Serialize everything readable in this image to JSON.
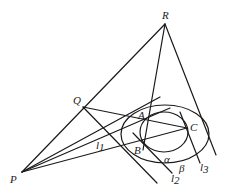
{
  "diagram": {
    "type": "geometry",
    "points": {
      "R": {
        "label": "R",
        "x": 165,
        "y": 24
      },
      "Q": {
        "label": "Q",
        "x": 83,
        "y": 107
      },
      "P": {
        "label": "P",
        "x": 22,
        "y": 172
      },
      "A": {
        "label": "A",
        "x": 146,
        "y": 121
      },
      "B": {
        "label": "B",
        "x": 142,
        "y": 140
      },
      "C": {
        "label": "C",
        "x": 187,
        "y": 128
      }
    },
    "planes": {
      "alpha": {
        "label": "α"
      },
      "beta": {
        "label": "β"
      }
    },
    "lines": {
      "l1": {
        "label": "l",
        "sub": "1"
      },
      "l2": {
        "label": "l",
        "sub": "2"
      },
      "l3": {
        "label": "l",
        "sub": "3"
      }
    }
  }
}
